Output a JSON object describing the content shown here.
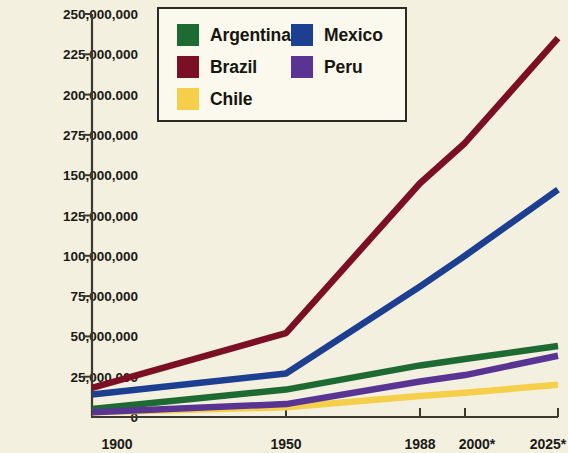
{
  "chart_data": {
    "type": "line",
    "title": "",
    "xlabel": "",
    "ylabel": "",
    "x": [
      "1900",
      "1950",
      "1988",
      "2000*",
      "2025*"
    ],
    "categories": [
      "1900",
      "1950",
      "1988",
      "2000*",
      "2025*"
    ],
    "ylim": [
      0,
      250000000
    ],
    "xlim": [
      1900,
      2025
    ],
    "grid": false,
    "legend_position": "top-center",
    "y_ticks": [
      {
        "value": 250000000,
        "label": "250,000,000"
      },
      {
        "value": 225000000,
        "label": "225,000,000"
      },
      {
        "value": 200000000,
        "label": "200.000.000"
      },
      {
        "value": 175000000,
        "label": "275,000,000"
      },
      {
        "value": 150000000,
        "label": "150,000,000"
      },
      {
        "value": 125000000,
        "label": "125,000,000"
      },
      {
        "value": 100000000,
        "label": "100,000,000"
      },
      {
        "value": 75000000,
        "label": "75,000,000"
      },
      {
        "value": 50000000,
        "label": "50,000,000"
      },
      {
        "value": 25000000,
        "label": "25,000,000"
      },
      {
        "value": 0,
        "label": "0"
      }
    ],
    "x_ticks": [
      {
        "value": 1900,
        "label": "1900"
      },
      {
        "value": 1950,
        "label": "1950"
      },
      {
        "value": 1988,
        "label": "1988"
      },
      {
        "value": 2000,
        "label": "2000*"
      },
      {
        "value": 2025,
        "label": "2025*"
      }
    ],
    "series": [
      {
        "name": "Argentina",
        "color": "#1d6b32",
        "values": [
          5000000,
          17000000,
          32000000,
          36000000,
          44000000
        ]
      },
      {
        "name": "Brazil",
        "color": "#7b1024",
        "values": [
          18000000,
          52000000,
          145000000,
          170000000,
          235000000
        ]
      },
      {
        "name": "Chile",
        "color": "#f6cf4a",
        "values": [
          3000000,
          6000000,
          13000000,
          15000000,
          20000000
        ]
      },
      {
        "name": "Mexico",
        "color": "#1d3f92",
        "values": [
          14000000,
          27000000,
          81000000,
          100000000,
          141000000
        ]
      },
      {
        "name": "Peru",
        "color": "#5a3492",
        "values": [
          3000000,
          8000000,
          22000000,
          26000000,
          38000000
        ]
      }
    ]
  },
  "legend": {
    "entries": [
      {
        "label": "Argentina",
        "color": "#1d6b32"
      },
      {
        "label": "Mexico",
        "color": "#1d3f92"
      },
      {
        "label": "Brazil",
        "color": "#7b1024"
      },
      {
        "label": "Peru",
        "color": "#5a3492"
      },
      {
        "label": "Chile",
        "color": "#f6cf4a"
      }
    ]
  },
  "colors": {
    "background": "#f3f0e0",
    "axis": "#3b3a30",
    "text": "#1a1a16",
    "legend_background": "#fbf9ee",
    "legend_border": "#2a2a24"
  }
}
